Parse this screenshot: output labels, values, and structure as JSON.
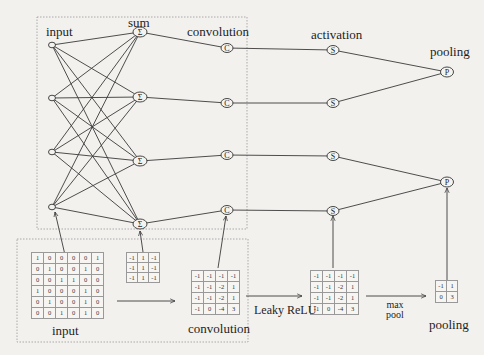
{
  "top_diagram": {
    "labels": {
      "input": "input",
      "sum": "sum",
      "convolution": "convolution",
      "activation": "activation",
      "pooling": "pooling"
    },
    "node_symbols": {
      "sum": "Σ",
      "convolution": "C",
      "activation": "S",
      "pooling": "P"
    },
    "input_nodes": [
      {
        "x": 52,
        "y": 45
      },
      {
        "x": 52,
        "y": 98
      },
      {
        "x": 52,
        "y": 152
      },
      {
        "x": 52,
        "y": 207
      }
    ],
    "sum_nodes": [
      {
        "x": 140,
        "y": 32
      },
      {
        "x": 140,
        "y": 97
      },
      {
        "x": 140,
        "y": 161
      },
      {
        "x": 140,
        "y": 224
      }
    ],
    "conv_nodes": [
      {
        "x": 227,
        "y": 48
      },
      {
        "x": 227,
        "y": 103
      },
      {
        "x": 227,
        "y": 155
      },
      {
        "x": 227,
        "y": 210
      }
    ],
    "activation_nodes": [
      {
        "x": 333,
        "y": 50
      },
      {
        "x": 333,
        "y": 103
      },
      {
        "x": 333,
        "y": 156
      },
      {
        "x": 333,
        "y": 211
      }
    ],
    "pooling_nodes": [
      {
        "x": 447,
        "y": 72
      },
      {
        "x": 447,
        "y": 182
      }
    ]
  },
  "bottom_diagram": {
    "input_label": "input",
    "convolution_label": "convolution",
    "pooling_label": "pooling",
    "leaky_relu_label": "Leaky ReLU",
    "max_pool_label_line1": "max",
    "max_pool_label_line2": "pool",
    "input_matrix": [
      [
        "1",
        "0",
        "0",
        "0",
        "0",
        "1"
      ],
      [
        "0",
        "1",
        "0",
        "0",
        "1",
        "0"
      ],
      [
        "0",
        "0",
        "1",
        "1",
        "0",
        "0"
      ],
      [
        "1",
        "0",
        "0",
        "0",
        "1",
        "0"
      ],
      [
        "0",
        "1",
        "0",
        "0",
        "1",
        "0"
      ],
      [
        "0",
        "0",
        "1",
        "0",
        "1",
        "0"
      ]
    ],
    "kernel_matrix": [
      [
        "-1",
        "1",
        "-1"
      ],
      [
        "-1",
        "1",
        "-1"
      ],
      [
        "-1",
        "1",
        "-1"
      ]
    ],
    "convolution_matrix": [
      [
        "-1",
        "-1",
        "-1",
        "-1"
      ],
      [
        "-1",
        "-1",
        "-2",
        "1"
      ],
      [
        "-1",
        "-1",
        "-2",
        "1"
      ],
      [
        "-1",
        "0",
        "-4",
        "3"
      ]
    ],
    "activation_matrix": [
      [
        "-1",
        "-1",
        "-1",
        "-1"
      ],
      [
        "-1",
        "-1",
        "-2",
        "1"
      ],
      [
        "-1",
        "-1",
        "-2",
        "1"
      ],
      [
        "-1",
        "0",
        "-4",
        "3"
      ]
    ],
    "pooling_matrix": [
      [
        "-1",
        "1"
      ],
      [
        "0",
        "3"
      ]
    ]
  },
  "colors": {
    "background": "#f2f1ee",
    "line": "#3a3a3a",
    "dotted_box": "#9a9a9a"
  }
}
